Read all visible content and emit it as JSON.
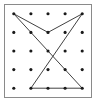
{
  "figure": {
    "frame": {
      "border_color": "#8a8a8a",
      "background_color": "#ffffff",
      "border_width_px": 1
    },
    "grid": {
      "rows": 5,
      "columns": 5,
      "dot_color": "#1a1a1a",
      "dot_radius_px": 1.6,
      "origin_x": 9,
      "origin_y": 9,
      "spacing_x": 17.5,
      "spacing_y": 19,
      "points": [
        {
          "row": 1,
          "col": 1
        },
        {
          "row": 1,
          "col": 2
        },
        {
          "row": 1,
          "col": 3
        },
        {
          "row": 1,
          "col": 4
        },
        {
          "row": 1,
          "col": 5
        },
        {
          "row": 2,
          "col": 1
        },
        {
          "row": 2,
          "col": 2
        },
        {
          "row": 2,
          "col": 3
        },
        {
          "row": 2,
          "col": 4
        },
        {
          "row": 2,
          "col": 5
        },
        {
          "row": 3,
          "col": 1
        },
        {
          "row": 3,
          "col": 2
        },
        {
          "row": 3,
          "col": 3
        },
        {
          "row": 3,
          "col": 4
        },
        {
          "row": 3,
          "col": 5
        },
        {
          "row": 4,
          "col": 1
        },
        {
          "row": 4,
          "col": 2
        },
        {
          "row": 4,
          "col": 3
        },
        {
          "row": 4,
          "col": 4
        },
        {
          "row": 4,
          "col": 5
        },
        {
          "row": 5,
          "col": 1
        },
        {
          "row": 5,
          "col": 2
        },
        {
          "row": 5,
          "col": 3
        },
        {
          "row": 5,
          "col": 4
        },
        {
          "row": 5,
          "col": 5
        }
      ]
    },
    "segments": [
      {
        "name": "top-left-to-vee-vertex",
        "from": {
          "row": 1,
          "col": 1
        },
        "to": {
          "row": 2,
          "col": 3
        },
        "color": "#3c3c3c",
        "width_px": 1
      },
      {
        "name": "vee-vertex-to-top-right",
        "from": {
          "row": 2,
          "col": 3
        },
        "to": {
          "row": 1,
          "col": 5
        },
        "color": "#3c3c3c",
        "width_px": 1
      },
      {
        "name": "top-left-to-bottom-right",
        "from": {
          "row": 1,
          "col": 1
        },
        "to": {
          "row": 5,
          "col": 5
        },
        "color": "#3c3c3c",
        "width_px": 1
      },
      {
        "name": "top-right-to-bottom-left",
        "from": {
          "row": 1,
          "col": 5
        },
        "to": {
          "row": 5,
          "col": 2
        },
        "color": "#3c3c3c",
        "width_px": 1
      },
      {
        "name": "bottom-baseline",
        "from": {
          "row": 5,
          "col": 2
        },
        "to": {
          "row": 5,
          "col": 5
        },
        "color": "#7d7d7d",
        "width_px": 1.6
      }
    ]
  }
}
